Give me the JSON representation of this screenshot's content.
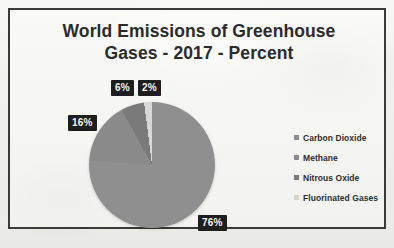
{
  "chart_data": {
    "type": "pie",
    "title": "World Emissions of Greenhouse Gases - 2017 - Percent",
    "title_line1": "World Emissions of Greenhouse",
    "title_line2": "Gases - 2017 - Percent",
    "categories": [
      "Carbon Dioxide",
      "Methane",
      "Nitrous Oxide",
      "Fluorinated Gases"
    ],
    "values": [
      76,
      16,
      6,
      2
    ],
    "value_labels": [
      "76%",
      "16%",
      "6%",
      "2%"
    ],
    "unit": "percent",
    "colors": [
      "#8f8f8f",
      "#8a8a8a",
      "#7a7a7a",
      "#d8d8d6"
    ],
    "legend_position": "right",
    "grid": false,
    "xlabel": "",
    "ylabel": ""
  },
  "labels": {
    "carbon_dioxide": "76%",
    "methane": "16%",
    "nitrous_oxide": "6%",
    "fluorinated_gases": "2%"
  },
  "legend": {
    "items": [
      {
        "label": "Carbon Dioxide"
      },
      {
        "label": "Methane"
      },
      {
        "label": "Nitrous Oxide"
      },
      {
        "label": "Fluorinated Gases"
      }
    ]
  }
}
